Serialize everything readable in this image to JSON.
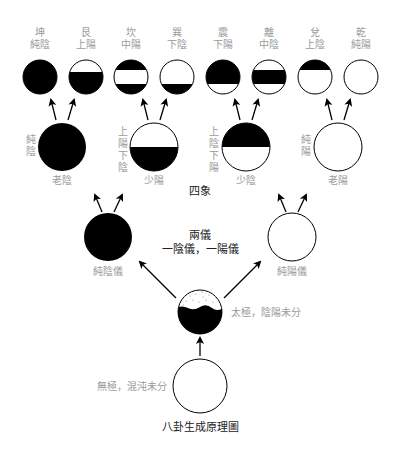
{
  "title": "八卦生成原理圖",
  "trigrams": [
    {
      "name": "坤",
      "desc": "純陰"
    },
    {
      "name": "艮",
      "desc": "上陽"
    },
    {
      "name": "坎",
      "desc": "中陽"
    },
    {
      "name": "巽",
      "desc": "下陰"
    },
    {
      "name": "震",
      "desc": "下陽"
    },
    {
      "name": "離",
      "desc": "中陰"
    },
    {
      "name": "兌",
      "desc": "上陰"
    },
    {
      "name": "乾",
      "desc": "純陽"
    }
  ],
  "four_symbols": {
    "heading": "四象",
    "items": [
      {
        "name": "老陰",
        "side_label": [
          "純",
          "陰"
        ]
      },
      {
        "name": "少陽",
        "side_label": [
          "上",
          "陽",
          "下",
          "陰"
        ]
      },
      {
        "name": "少陰",
        "side_label": [
          "上",
          "陰",
          "下",
          "陽"
        ]
      },
      {
        "name": "老陽",
        "side_label": [
          "純",
          "陽"
        ]
      }
    ]
  },
  "two_forms": {
    "heading": "兩儀",
    "subheading": "一陰儀，一陽儀",
    "yin_label": "純陰儀",
    "yang_label": "純陽儀"
  },
  "taiji": {
    "label": "太極，陰陽未分"
  },
  "wuji": {
    "label": "無極，混沌未分"
  },
  "colors": {
    "ink": "#000000",
    "label_gray": "#9a9a9a",
    "heading": "#222222"
  }
}
